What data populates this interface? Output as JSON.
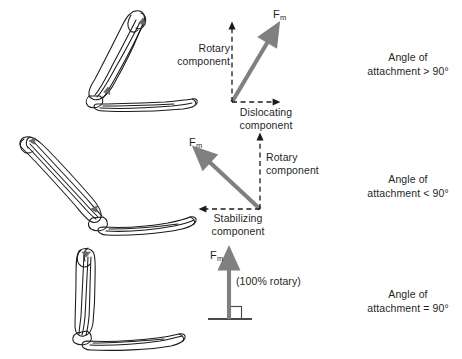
{
  "figure": {
    "background_color": "#ffffff",
    "arrow_color": "#808080",
    "dashed_color": "#1a1a1a",
    "bone_outline_color": "#1a1a1a",
    "rows": [
      {
        "id": "row-acute-flexion",
        "bone_illustration_name": "elbow-joint-flexed-past-90",
        "force_label": {
          "symbol": "F",
          "subscript": "m"
        },
        "components": [
          {
            "name": "rotary-component",
            "label_lines": [
              "Rotary",
              "component"
            ],
            "direction": "up"
          },
          {
            "name": "dislocating-component",
            "label_lines": [
              "Dislocating",
              "component"
            ],
            "direction": "right"
          }
        ],
        "caption_lines": [
          "Angle of",
          "attachment > 90°"
        ]
      },
      {
        "id": "row-obtuse-extension",
        "bone_illustration_name": "elbow-joint-extended-less-than-90",
        "force_label": {
          "symbol": "F",
          "subscript": "m"
        },
        "components": [
          {
            "name": "rotary-component",
            "label_lines": [
              "Rotary",
              "component"
            ],
            "direction": "up"
          },
          {
            "name": "stabilizing-component",
            "label_lines": [
              "Stabilizing",
              "component"
            ],
            "direction": "left"
          }
        ],
        "caption_lines": [
          "Angle of",
          "attachment < 90°"
        ]
      },
      {
        "id": "row-right-angle",
        "bone_illustration_name": "elbow-joint-at-90-degrees",
        "force_label": {
          "symbol": "F",
          "subscript": "m"
        },
        "components": [
          {
            "name": "pure-rotary-note",
            "label_lines": [
              "(100% rotary)"
            ],
            "direction": "up"
          }
        ],
        "caption_lines": [
          "Angle of",
          "attachment = 90°"
        ]
      }
    ]
  }
}
